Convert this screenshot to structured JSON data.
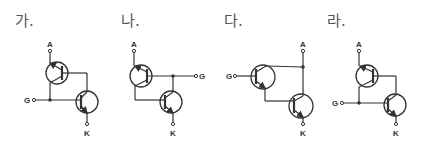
{
  "options": [
    {
      "id": "ga",
      "label": "가.",
      "terminals": {
        "anode": "A",
        "gate": "G",
        "cathode": "K"
      },
      "description": "PNP top transistor (emitter to A), NPN bottom transistor (emitter to K); gate G joins top collector and bottom base on the left; top base tied to bottom collector on the right"
    },
    {
      "id": "na",
      "label": "나.",
      "terminals": {
        "anode": "A",
        "gate": "G",
        "cathode": "K"
      },
      "description": "PNP top transistor (emitter to A); gate G on right connected to top base and bottom collector; top collector wired to bottom base"
    },
    {
      "id": "da",
      "label": "다.",
      "terminals": {
        "anode": "A",
        "gate": "G",
        "cathode": "K"
      },
      "description": "Gate G drives base of top NPN; top collector and bottom collector joined to anode A rail; top emitter drives bottom base; bottom emitter to K"
    },
    {
      "id": "ra",
      "label": "라.",
      "terminals": {
        "anode": "A",
        "gate": "G",
        "cathode": "K"
      },
      "description": "PNP top transistor (emitter to A); gate G on left connected to top collector and bottom base; top base connected to bottom collector"
    }
  ],
  "colors": {
    "line": "#333333",
    "label": "#555555",
    "background": "#ffffff"
  }
}
